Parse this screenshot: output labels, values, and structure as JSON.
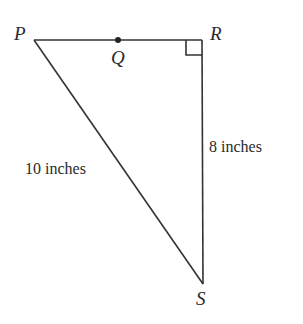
{
  "diagram": {
    "type": "right-triangle",
    "points": {
      "P": {
        "label": "P",
        "x": 34,
        "y": 40
      },
      "Q": {
        "label": "Q",
        "x": 118,
        "y": 40
      },
      "R": {
        "label": "R",
        "x": 202,
        "y": 40
      },
      "S": {
        "label": "S",
        "x": 203,
        "y": 284
      }
    },
    "segments": [
      {
        "from": "P",
        "to": "R"
      },
      {
        "from": "R",
        "to": "S"
      },
      {
        "from": "P",
        "to": "S"
      }
    ],
    "right_angle_at": "R",
    "measurements": {
      "PS": "10 inches",
      "RS": "8 inches"
    },
    "colors": {
      "line": "#333333",
      "text": "#2a2a2a",
      "background": "#ffffff"
    }
  }
}
